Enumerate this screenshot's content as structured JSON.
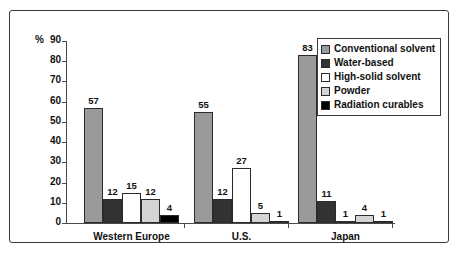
{
  "chart_data": {
    "type": "bar",
    "title": "",
    "xlabel": "",
    "ylabel": "%",
    "ylim": [
      0,
      90
    ],
    "ytick_step": 10,
    "yticks": [
      90,
      80,
      70,
      60,
      50,
      40,
      30,
      20,
      10,
      0
    ],
    "grid": false,
    "legend_position": "top-right",
    "categories": [
      "Western Europe",
      "U.S.",
      "Japan"
    ],
    "series": [
      {
        "name": "Conventional solvent",
        "color": "#9a9a9a",
        "values": [
          57,
          55,
          83
        ]
      },
      {
        "name": "Water-based",
        "color": "#333333",
        "values": [
          12,
          12,
          11
        ]
      },
      {
        "name": "High-solid solvent",
        "color": "#ffffff",
        "values": [
          15,
          27,
          1
        ]
      },
      {
        "name": "Powder",
        "color": "#d4d4d4",
        "values": [
          12,
          5,
          4
        ]
      },
      {
        "name": "Radiation curables",
        "color": "#000000",
        "values": [
          4,
          1,
          1
        ]
      }
    ]
  },
  "axis": {
    "unit_label": "%"
  }
}
